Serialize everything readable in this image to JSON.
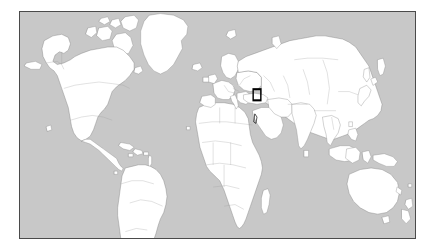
{
  "page": {
    "background_color": "#ffffff",
    "width": 436,
    "height": 252
  },
  "map": {
    "title": "World Map",
    "projection": "equirectangular",
    "frame": {
      "x": 19,
      "y": 11,
      "width": 397,
      "height": 228,
      "border_color": "#4a4a4a",
      "border_width": 1
    },
    "ocean_color": "#c8c8c8",
    "land_color": "#ffffff",
    "coastline_color": "#7d7d7d",
    "country_border_color": "#9c9c9c",
    "extent": {
      "lon_min": -180,
      "lon_max": 180,
      "lat_min": -58,
      "lat_max": 84
    },
    "graticule": false,
    "labels": []
  },
  "highlight": {
    "type": "locator-rectangle",
    "region_name": "Eastern Mediterranean / Levant",
    "color": "#000000",
    "stroke_width": 1.3,
    "screen_box": {
      "x": 250,
      "y": 112,
      "width": 16,
      "height": 15
    },
    "geo_box": {
      "lon_min": 32.5,
      "lon_max": 39.5,
      "lat_min": 28.5,
      "lat_max": 35.5
    }
  },
  "chart_data": {
    "type": "map",
    "subtitle": "",
    "legend": [],
    "annotations": [
      {
        "label": "locator box",
        "lon": 36.0,
        "lat": 32.0
      }
    ]
  }
}
